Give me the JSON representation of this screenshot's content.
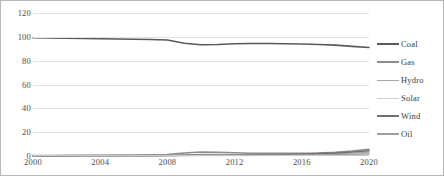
{
  "chart_data": {
    "type": "line",
    "title": "",
    "xlabel": "",
    "ylabel": "",
    "xlim": [
      2000,
      2020
    ],
    "ylim": [
      0,
      120
    ],
    "grid": true,
    "legend_position": "right",
    "x": [
      2000,
      2001,
      2002,
      2003,
      2004,
      2005,
      2006,
      2007,
      2008,
      2009,
      2010,
      2011,
      2012,
      2013,
      2014,
      2015,
      2016,
      2017,
      2018,
      2019,
      2020
    ],
    "x_ticks": [
      "2000",
      "2004",
      "2008",
      "2012",
      "2016",
      "2020"
    ],
    "y_ticks": [
      "0",
      "20",
      "40",
      "60",
      "80",
      "100",
      "120"
    ],
    "series": [
      {
        "name": "Coal",
        "color": "#595959",
        "width": 1.6,
        "values": [
          99.2,
          99.0,
          98.8,
          98.6,
          98.4,
          98.2,
          98.0,
          97.8,
          97.4,
          94.6,
          93.4,
          93.6,
          94.2,
          94.4,
          94.4,
          94.2,
          94.0,
          93.6,
          93.0,
          92.0,
          91.0
        ]
      },
      {
        "name": "Gas",
        "color": "#8c8c8c",
        "width": 1.5,
        "values": [
          0.5,
          0.5,
          0.6,
          0.6,
          0.7,
          0.8,
          0.9,
          1.0,
          1.2,
          2.6,
          3.4,
          3.2,
          2.8,
          2.4,
          2.3,
          2.3,
          2.4,
          2.6,
          3.2,
          4.2,
          5.6
        ]
      },
      {
        "name": "Hydro",
        "color": "#a6a6a6",
        "width": 1.3,
        "values": [
          0.3,
          0.3,
          0.3,
          0.4,
          0.4,
          0.4,
          0.5,
          0.5,
          0.6,
          1.0,
          1.3,
          1.3,
          1.2,
          1.1,
          1.1,
          1.2,
          1.3,
          1.5,
          1.9,
          2.4,
          3.2
        ]
      },
      {
        "name": "Solar",
        "color": "#d0d0d0",
        "width": 1.2,
        "values": [
          0.0,
          0.0,
          0.0,
          0.0,
          0.0,
          0.0,
          0.0,
          0.0,
          0.1,
          0.1,
          0.2,
          0.2,
          0.3,
          0.3,
          0.4,
          0.5,
          0.6,
          0.8,
          1.0,
          1.3,
          1.8
        ]
      },
      {
        "name": "Wind",
        "color": "#707070",
        "width": 1.5,
        "values": [
          0.1,
          0.1,
          0.1,
          0.2,
          0.2,
          0.2,
          0.3,
          0.3,
          0.4,
          0.6,
          0.8,
          0.9,
          0.9,
          1.0,
          1.1,
          1.3,
          1.6,
          2.0,
          2.6,
          3.4,
          4.4
        ]
      },
      {
        "name": "Oil",
        "color": "#9e9e9e",
        "width": 1.4,
        "values": [
          0.2,
          0.2,
          0.2,
          0.2,
          0.3,
          0.3,
          0.3,
          0.3,
          0.4,
          0.5,
          0.6,
          0.6,
          0.6,
          0.6,
          0.7,
          0.7,
          0.8,
          0.9,
          1.1,
          1.4,
          1.8
        ]
      }
    ]
  },
  "legend": {
    "items": [
      {
        "label": "Coal"
      },
      {
        "label": "Gas"
      },
      {
        "label": "Hydro"
      },
      {
        "label": "Solar"
      },
      {
        "label": "Wind"
      },
      {
        "label": "Oil"
      }
    ]
  }
}
